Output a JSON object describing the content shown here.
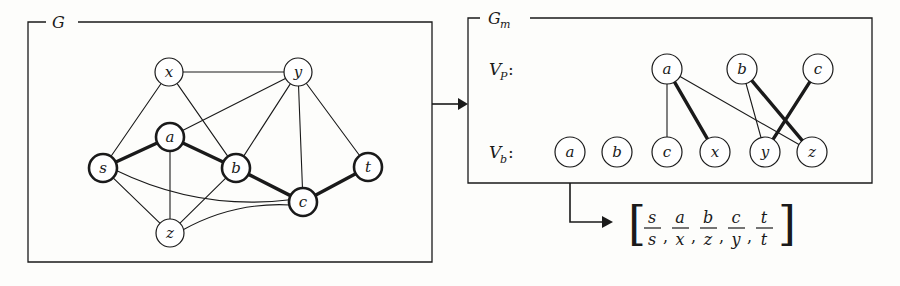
{
  "figure": {
    "kind": "diagram",
    "stroke_color": "#1a1a1a",
    "fill_color": "#ffffff",
    "background_color": "#fdfdfb"
  },
  "panels": {
    "left": {
      "label": "G",
      "x": 28,
      "y": 22,
      "w": 404,
      "h": 240
    },
    "right": {
      "label": "G",
      "label_sub": "m",
      "x": 468,
      "y": 18,
      "w": 404,
      "h": 165
    }
  },
  "row_labels": {
    "pattern": {
      "base": "V",
      "sub": "P",
      "colon": ":"
    },
    "base": {
      "base": "V",
      "sub": "b",
      "colon": ":"
    }
  },
  "graph_G": {
    "nodes": [
      {
        "id": "x",
        "label": "x",
        "cx": 169,
        "cy": 72,
        "r": 14,
        "bold": false
      },
      {
        "id": "y",
        "label": "y",
        "cx": 298,
        "cy": 72,
        "r": 14,
        "bold": false
      },
      {
        "id": "a",
        "label": "a",
        "cx": 170,
        "cy": 137,
        "r": 14,
        "bold": true
      },
      {
        "id": "s",
        "label": "s",
        "cx": 103,
        "cy": 168,
        "r": 14,
        "bold": true
      },
      {
        "id": "b",
        "label": "b",
        "cx": 236,
        "cy": 168,
        "r": 14,
        "bold": true
      },
      {
        "id": "c",
        "label": "c",
        "cx": 303,
        "cy": 202,
        "r": 14,
        "bold": true
      },
      {
        "id": "t",
        "label": "t",
        "cx": 368,
        "cy": 167,
        "r": 14,
        "bold": true
      },
      {
        "id": "z",
        "label": "z",
        "cx": 170,
        "cy": 233,
        "r": 14,
        "bold": false
      }
    ],
    "edges": [
      {
        "from": "x",
        "to": "y",
        "bold": false,
        "curve": 0
      },
      {
        "from": "x",
        "to": "s",
        "bold": false,
        "curve": 0
      },
      {
        "from": "x",
        "to": "b",
        "bold": false,
        "curve": 0
      },
      {
        "from": "y",
        "to": "a",
        "bold": false,
        "curve": 0
      },
      {
        "from": "y",
        "to": "b",
        "bold": false,
        "curve": 0
      },
      {
        "from": "y",
        "to": "c",
        "bold": false,
        "curve": 0
      },
      {
        "from": "y",
        "to": "t",
        "bold": false,
        "curve": 0
      },
      {
        "from": "s",
        "to": "a",
        "bold": true,
        "curve": 0
      },
      {
        "from": "a",
        "to": "b",
        "bold": true,
        "curve": 0
      },
      {
        "from": "b",
        "to": "c",
        "bold": true,
        "curve": 0
      },
      {
        "from": "c",
        "to": "t",
        "bold": true,
        "curve": 0
      },
      {
        "from": "a",
        "to": "z",
        "bold": false,
        "curve": 0
      },
      {
        "from": "s",
        "to": "z",
        "bold": false,
        "curve": 0
      },
      {
        "from": "b",
        "to": "z",
        "bold": false,
        "curve": 0
      },
      {
        "from": "s",
        "to": "c",
        "bold": false,
        "curve": 26
      },
      {
        "from": "z",
        "to": "c",
        "bold": false,
        "curve": -16
      }
    ]
  },
  "graph_Gm": {
    "top_nodes": [
      {
        "id": "pa",
        "label": "a",
        "cx": 667,
        "cy": 69,
        "r": 15
      },
      {
        "id": "pb",
        "label": "b",
        "cx": 742,
        "cy": 69,
        "r": 15
      },
      {
        "id": "pc",
        "label": "c",
        "cx": 818,
        "cy": 69,
        "r": 15
      }
    ],
    "bottom_nodes": [
      {
        "id": "ba",
        "label": "a",
        "cx": 570,
        "cy": 152,
        "r": 15
      },
      {
        "id": "bb",
        "label": "b",
        "cx": 617,
        "cy": 152,
        "r": 15
      },
      {
        "id": "bc",
        "label": "c",
        "cx": 667,
        "cy": 152,
        "r": 15
      },
      {
        "id": "bx",
        "label": "x",
        "cx": 715,
        "cy": 152,
        "r": 15
      },
      {
        "id": "by",
        "label": "y",
        "cx": 765,
        "cy": 152,
        "r": 15
      },
      {
        "id": "bz",
        "label": "z",
        "cx": 812,
        "cy": 152,
        "r": 15
      }
    ],
    "edges": [
      {
        "from": "pa",
        "to": "bc",
        "bold": false
      },
      {
        "from": "pa",
        "to": "bx",
        "bold": true
      },
      {
        "from": "pa",
        "to": "bz",
        "bold": false
      },
      {
        "from": "pb",
        "to": "by",
        "bold": false
      },
      {
        "from": "pb",
        "to": "bz",
        "bold": true
      },
      {
        "from": "pc",
        "to": "by",
        "bold": true
      }
    ]
  },
  "arrows": {
    "between_panels": {
      "label": "transform-arrow",
      "x1": 432,
      "y1": 104,
      "x2": 468,
      "y2": 104
    },
    "to_result": {
      "label": "result-arrow",
      "points": "570,183 570,222 613,222"
    }
  },
  "result": {
    "open_bracket": "[",
    "close_bracket": "]",
    "separator": ",",
    "pairs": [
      {
        "num": "s",
        "den": "s"
      },
      {
        "num": "a",
        "den": "x"
      },
      {
        "num": "b",
        "den": "z"
      },
      {
        "num": "c",
        "den": "y"
      },
      {
        "num": "t",
        "den": "t"
      }
    ]
  }
}
